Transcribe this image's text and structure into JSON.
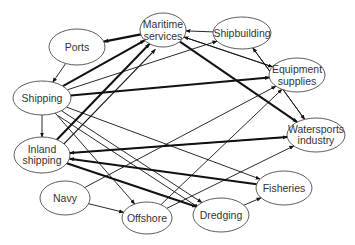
{
  "diagram": {
    "type": "directed-network",
    "nodes": [
      {
        "id": "maritime",
        "lines": [
          "Maritime",
          "services"
        ],
        "x": 163,
        "y": 30,
        "rx": 23,
        "ry": 17
      },
      {
        "id": "ports",
        "lines": [
          "Ports"
        ],
        "x": 77,
        "y": 47,
        "rx": 28,
        "ry": 18
      },
      {
        "id": "shipbuilding",
        "lines": [
          "Shipbuilding"
        ],
        "x": 242,
        "y": 33,
        "rx": 29,
        "ry": 16
      },
      {
        "id": "shipping",
        "lines": [
          "Shipping"
        ],
        "x": 42,
        "y": 98,
        "rx": 29,
        "ry": 17
      },
      {
        "id": "equipment",
        "lines": [
          "Equipment",
          "supplies"
        ],
        "x": 297,
        "y": 75,
        "rx": 28,
        "ry": 17
      },
      {
        "id": "inland",
        "lines": [
          "Inland",
          "shipping"
        ],
        "x": 42,
        "y": 155,
        "rx": 28,
        "ry": 18
      },
      {
        "id": "watersports",
        "lines": [
          "Watersports",
          "industry"
        ],
        "x": 316,
        "y": 135,
        "rx": 29,
        "ry": 17
      },
      {
        "id": "navy",
        "lines": [
          "Navy"
        ],
        "x": 65,
        "y": 198,
        "rx": 25,
        "ry": 17
      },
      {
        "id": "fisheries",
        "lines": [
          "Fisheries"
        ],
        "x": 284,
        "y": 188,
        "rx": 28,
        "ry": 17
      },
      {
        "id": "offshore",
        "lines": [
          "Offshore"
        ],
        "x": 147,
        "y": 218,
        "rx": 25,
        "ry": 16
      },
      {
        "id": "dredging",
        "lines": [
          "Dredging"
        ],
        "x": 221,
        "y": 215,
        "rx": 28,
        "ry": 17
      }
    ],
    "edges": [
      {
        "from": "maritime",
        "to": "ports",
        "weight": 2.2
      },
      {
        "from": "ports",
        "to": "shipping",
        "weight": 0.9
      },
      {
        "from": "shipbuilding",
        "to": "maritime",
        "weight": 0.9
      },
      {
        "from": "shipping",
        "to": "inland",
        "weight": 0.9
      },
      {
        "from": "shipping",
        "to": "maritime",
        "weight": 2.0
      },
      {
        "from": "inland",
        "to": "maritime",
        "weight": 2.0
      },
      {
        "from": "inland",
        "to": "maritime",
        "weight": 1.2,
        "offset": 8
      },
      {
        "from": "shipping",
        "to": "shipbuilding",
        "weight": 0.9
      },
      {
        "from": "shipping",
        "to": "equipment",
        "weight": 2.0
      },
      {
        "from": "shipping",
        "to": "fisheries",
        "weight": 0.9
      },
      {
        "from": "shipping",
        "to": "dredging",
        "weight": 0.9
      },
      {
        "from": "shipping",
        "to": "dredging",
        "weight": 0.9,
        "offset": 6
      },
      {
        "from": "maritime",
        "to": "equipment",
        "weight": 0.9
      },
      {
        "from": "equipment",
        "to": "maritime",
        "weight": 0.9
      },
      {
        "from": "maritime",
        "to": "watersports",
        "weight": 2.0
      },
      {
        "from": "shipbuilding",
        "to": "watersports",
        "weight": 0.9
      },
      {
        "from": "watersports",
        "to": "shipbuilding",
        "weight": 0.9
      },
      {
        "from": "watersports",
        "to": "inland",
        "weight": 2.0
      },
      {
        "from": "fisheries",
        "to": "inland",
        "weight": 2.0
      },
      {
        "from": "inland",
        "to": "dredging",
        "weight": 2.0
      },
      {
        "from": "inland",
        "to": "watersports",
        "weight": 0.9,
        "start_offset": [
          30,
          -5
        ]
      },
      {
        "from": "navy",
        "to": "offshore",
        "weight": 0.9
      },
      {
        "from": "navy",
        "to": "equipment",
        "weight": 0.9
      },
      {
        "from": "offshore",
        "to": "equipment",
        "weight": 0.9
      },
      {
        "from": "offshore",
        "to": "watersports",
        "weight": 0.9
      },
      {
        "from": "dredging",
        "to": "fisheries",
        "weight": 0.9
      },
      {
        "from": "shipping",
        "to": "offshore",
        "weight": 0.9
      }
    ],
    "colors": {
      "stroke": "#111111",
      "node_border": "#333333",
      "text": "#333333",
      "background": "#ffffff"
    }
  }
}
